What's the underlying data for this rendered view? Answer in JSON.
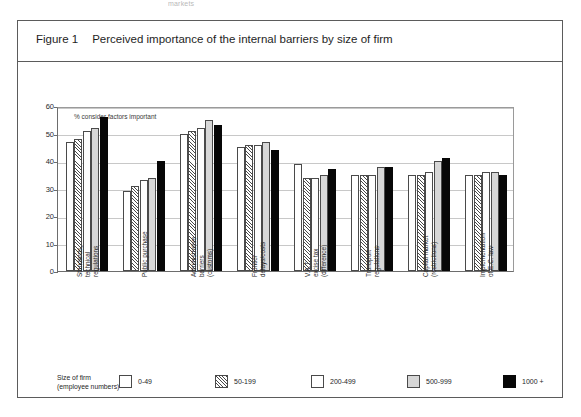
{
  "top_sliver_text": "markets",
  "figure": {
    "number_label": "Figure 1",
    "title": "Perceived importance of the internal barriers by size of firm"
  },
  "chart_data": {
    "type": "bar",
    "title": "Perceived importance of the internal barriers by size of firm",
    "xlabel": "",
    "ylabel": "% consider factors important",
    "ylim": [
      0,
      60
    ],
    "yticks": [
      0,
      10,
      20,
      30,
      40,
      50,
      60
    ],
    "grid": true,
    "legend_position": "bottom",
    "legend_title": "Size of firm (employee numbers)",
    "categories": [
      "Standards, technical regulations",
      "Public purchase",
      "Administrative barriers (customs)",
      "Frontier delays/costs",
      "V.A.T. excise tax (difference)",
      "Transport regulations",
      "Capital market (restrictions)",
      "Implementation of EC law"
    ],
    "category_lines": [
      [
        "Standards,",
        "technical",
        "regulations"
      ],
      [
        "Public purchase"
      ],
      [
        "Administrative",
        "barriers",
        "(customs)"
      ],
      [
        "Frontier",
        "delays/costs"
      ],
      [
        "V.A.T.",
        "excise tax",
        "(difference)"
      ],
      [
        "Transport",
        "regulations"
      ],
      [
        "Capital market",
        "(restrictions)"
      ],
      [
        "Implementation",
        "of E.C. law"
      ]
    ],
    "series": [
      {
        "name": "0-49",
        "fill": "white",
        "values": [
          47,
          29,
          50,
          45,
          39,
          35,
          35,
          35
        ]
      },
      {
        "name": "50-199",
        "fill": "hatch",
        "values": [
          48,
          31,
          51,
          46,
          34,
          35,
          35,
          35
        ]
      },
      {
        "name": "200-499",
        "fill": "white",
        "values": [
          51,
          33,
          52,
          46,
          34,
          35,
          36,
          36
        ]
      },
      {
        "name": "500-999",
        "fill": "gray",
        "values": [
          52,
          34,
          55,
          47,
          35,
          38,
          40,
          36
        ]
      },
      {
        "name": "1000 +",
        "fill": "black",
        "values": [
          56,
          40,
          53,
          44,
          37,
          38,
          41,
          35
        ]
      }
    ]
  }
}
